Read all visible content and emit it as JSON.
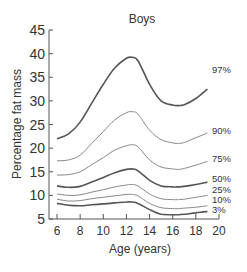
{
  "chart_data": {
    "type": "line",
    "title": "Boys",
    "xlabel": "Age (years)",
    "ylabel": "Percentage fat mass",
    "xlim": [
      6,
      20
    ],
    "ylim": [
      5,
      45
    ],
    "xticks": [
      6,
      8,
      10,
      12,
      14,
      16,
      18,
      20
    ],
    "yticks": [
      5,
      10,
      15,
      20,
      25,
      30,
      35,
      40,
      45
    ],
    "grid": false,
    "legend_position": "inline-right",
    "x": [
      6,
      7,
      8,
      9,
      10,
      11,
      12,
      12.5,
      13,
      14,
      15,
      16,
      16.5,
      17,
      18,
      19
    ],
    "series": [
      {
        "name": "97%",
        "color": "#555555",
        "width": 1.6,
        "values": [
          22.0,
          23.0,
          25.5,
          29.5,
          33.5,
          37.0,
          39.0,
          39.2,
          38.5,
          33.5,
          30.0,
          29.1,
          29.0,
          29.2,
          30.5,
          32.5
        ]
      },
      {
        "name": "90%",
        "color": "#888888",
        "width": 1.0,
        "values": [
          17.3,
          17.5,
          18.5,
          21.0,
          23.5,
          26.0,
          27.5,
          27.7,
          27.2,
          23.8,
          21.8,
          21.1,
          21.0,
          21.2,
          22.2,
          23.2
        ]
      },
      {
        "name": "75%",
        "color": "#888888",
        "width": 1.0,
        "values": [
          14.3,
          14.4,
          15.0,
          16.5,
          18.0,
          19.6,
          20.5,
          20.7,
          20.3,
          17.5,
          16.0,
          15.6,
          15.5,
          15.7,
          16.4,
          17.2
        ]
      },
      {
        "name": "50%",
        "color": "#555555",
        "width": 1.6,
        "values": [
          12.0,
          11.7,
          11.9,
          12.8,
          13.8,
          14.8,
          15.5,
          15.6,
          15.2,
          13.2,
          12.0,
          11.8,
          11.8,
          11.9,
          12.3,
          12.8
        ]
      },
      {
        "name": "25%",
        "color": "#888888",
        "width": 1.0,
        "values": [
          10.3,
          10.0,
          10.1,
          10.7,
          11.2,
          11.8,
          12.2,
          12.3,
          12.0,
          10.3,
          9.3,
          9.1,
          9.1,
          9.2,
          9.6,
          10.0
        ]
      },
      {
        "name": "10%",
        "color": "#888888",
        "width": 1.0,
        "values": [
          9.2,
          8.8,
          8.9,
          9.3,
          9.6,
          9.9,
          10.2,
          10.2,
          9.9,
          8.3,
          7.4,
          7.2,
          7.2,
          7.3,
          7.5,
          7.8
        ]
      },
      {
        "name": "3%",
        "color": "#555555",
        "width": 1.6,
        "values": [
          8.3,
          7.9,
          7.8,
          8.0,
          8.2,
          8.4,
          8.6,
          8.6,
          8.3,
          7.0,
          6.0,
          5.9,
          5.9,
          6.0,
          6.3,
          6.6
        ]
      }
    ]
  }
}
